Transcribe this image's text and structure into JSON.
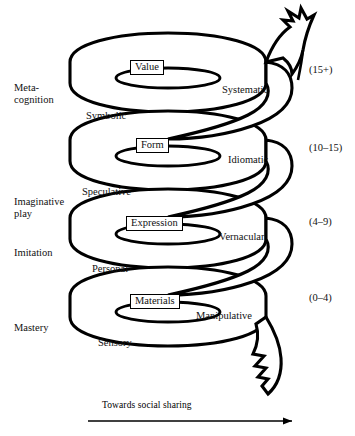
{
  "diagram": {
    "caption": "Towards social sharing",
    "background_color": "#ffffff",
    "ink_color": "#000000",
    "stages": [
      {
        "id": "metacognition",
        "label": "Meta-\ncognition",
        "top": 82
      },
      {
        "id": "imaginative-play",
        "label": "Imaginative\nplay",
        "top": 196
      },
      {
        "id": "imitation",
        "label": "Imitation",
        "top": 247
      },
      {
        "id": "mastery",
        "label": "Mastery",
        "top": 322
      }
    ],
    "age_ranges": [
      {
        "id": "age-15-plus",
        "label": "(15+)",
        "top": 64
      },
      {
        "id": "age-10-15",
        "label": "(10–15)",
        "top": 142
      },
      {
        "id": "age-4-9",
        "label": "(4–9)",
        "top": 216
      },
      {
        "id": "age-0-4",
        "label": "(0–4)",
        "top": 292
      }
    ],
    "boxed_modes": [
      {
        "id": "value",
        "label": "Value",
        "left": 130,
        "top": 60
      },
      {
        "id": "form",
        "label": "Form",
        "left": 134,
        "top": 138
      },
      {
        "id": "expression",
        "label": "Expression",
        "left": 128,
        "top": 216
      },
      {
        "id": "materials",
        "label": "Materials",
        "left": 132,
        "top": 294
      }
    ],
    "band_labels": [
      {
        "id": "systematic",
        "label": "Systematic",
        "left": 222,
        "top": 84,
        "side": "right"
      },
      {
        "id": "symbolic",
        "label": "Symbolic",
        "left": 86,
        "top": 110,
        "side": "left"
      },
      {
        "id": "idiomatic",
        "label": "Idiomatic",
        "left": 228,
        "top": 154,
        "side": "right"
      },
      {
        "id": "speculative",
        "label": "Speculative",
        "left": 82,
        "top": 186,
        "side": "left"
      },
      {
        "id": "vernacular",
        "label": "Vernacular",
        "left": 219,
        "top": 231,
        "side": "right"
      },
      {
        "id": "personal",
        "label": "Personal",
        "left": 92,
        "top": 263,
        "side": "left"
      },
      {
        "id": "manipulative",
        "label": "Manipulative",
        "left": 196,
        "top": 310,
        "side": "right"
      },
      {
        "id": "sensory",
        "label": "Sensory",
        "left": 98,
        "top": 337,
        "side": "left"
      }
    ]
  }
}
